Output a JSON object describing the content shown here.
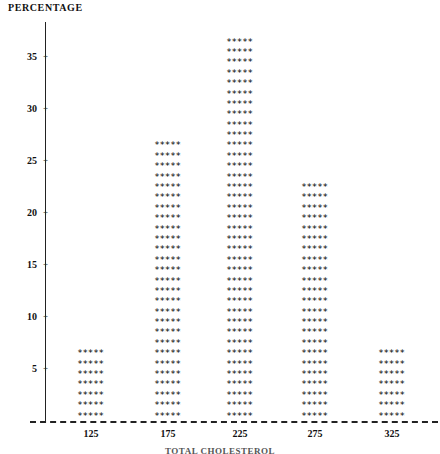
{
  "chart_data": {
    "type": "bar",
    "title": "PERCENTAGE",
    "xlabel": "TOTAL CHOLESTEROL",
    "ylabel": "PERCENTAGE",
    "categories": [
      "125",
      "175",
      "225",
      "275",
      "325"
    ],
    "values": [
      7,
      27,
      37,
      23,
      7
    ],
    "yticks": [
      "5",
      "10",
      "15",
      "20",
      "25",
      "30",
      "35"
    ],
    "ytick_values": [
      5,
      10,
      15,
      20,
      25,
      30,
      35
    ],
    "ylim": [
      0,
      38
    ],
    "grid": false,
    "legend": null,
    "marker": "*",
    "marker_per_row": 5,
    "series": [
      {
        "name": "PERCENTAGE",
        "values": [
          7,
          27,
          37,
          23,
          7
        ]
      }
    ]
  },
  "chart": {
    "title": "PERCENTAGE",
    "x_axis_title": "TOTAL CHOLESTEROL",
    "y_ticks": [
      {
        "label": "35",
        "value": 35
      },
      {
        "label": "30",
        "value": 30
      },
      {
        "label": "25",
        "value": 25
      },
      {
        "label": "20",
        "value": 20
      },
      {
        "label": "15",
        "value": 15
      },
      {
        "label": "10",
        "value": 10
      },
      {
        "label": "5",
        "value": 5
      }
    ],
    "tick_glyph": "+",
    "x_ticks": [
      {
        "label": "125"
      },
      {
        "label": "175"
      },
      {
        "label": "225"
      },
      {
        "label": "275"
      },
      {
        "label": "325"
      }
    ],
    "bars": [
      {
        "category": "125",
        "value": 7,
        "row_text": "*****"
      },
      {
        "category": "175",
        "value": 27,
        "row_text": "*****"
      },
      {
        "category": "225",
        "value": 37,
        "row_text": "*****"
      },
      {
        "category": "275",
        "value": 23,
        "row_text": "*****"
      },
      {
        "category": "325",
        "value": 7,
        "row_text": "*****"
      }
    ],
    "colors": {
      "ink": "#111111",
      "axis": "#222222",
      "marker": "#000000",
      "background": "#ffffff"
    }
  }
}
